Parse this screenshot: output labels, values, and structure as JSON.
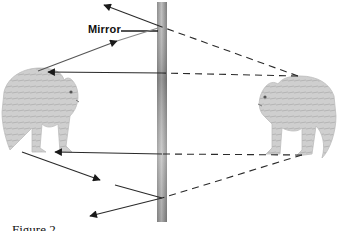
{
  "diagram": {
    "mirror_label": "Mirror",
    "caption": "Figure 2",
    "elements": {
      "mirror": {
        "x": 157,
        "y": 2,
        "width": 10,
        "height": 220
      },
      "left_cat": "image of cat (virtual image, facing right)",
      "right_cat": "cat facing left toward mirror"
    },
    "rays": [
      {
        "type": "dashed",
        "from": [
          298,
          76
        ],
        "to": [
          161,
          27
        ]
      },
      {
        "type": "solid",
        "from": [
          161,
          27
        ],
        "to": [
          104,
          5
        ],
        "arrow": true
      },
      {
        "type": "solid",
        "from": [
          38,
          71
        ],
        "to": [
          117,
          41
        ],
        "arrow": true
      },
      {
        "type": "dashed",
        "from": [
          298,
          76
        ],
        "to": [
          161,
          73
        ]
      },
      {
        "type": "solid",
        "from": [
          161,
          73
        ],
        "to": [
          48,
          72
        ],
        "arrow": true
      },
      {
        "type": "dashed",
        "from": [
          302,
          155
        ],
        "to": [
          161,
          154
        ]
      },
      {
        "type": "solid",
        "from": [
          161,
          154
        ],
        "to": [
          55,
          152
        ],
        "arrow": true
      },
      {
        "type": "dashed",
        "from": [
          302,
          155
        ],
        "to": [
          161,
          198
        ]
      },
      {
        "type": "solid",
        "from": [
          161,
          198
        ],
        "to": [
          90,
          216
        ],
        "arrow": true
      },
      {
        "type": "solid",
        "from": [
          22,
          152
        ],
        "to": [
          100,
          180
        ],
        "arrow": true
      },
      {
        "type": "solid",
        "from": [
          115,
          185
        ],
        "to": [
          161,
          198
        ]
      }
    ],
    "colors": {
      "ray": "#2a2a2a",
      "mirror_dark": "#6e6e6e",
      "mirror_light": "#c8c8c8",
      "cat_fur": "#c9c9c9"
    }
  }
}
